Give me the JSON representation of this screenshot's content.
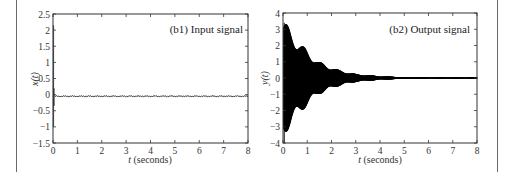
{
  "chart_data": [
    {
      "type": "line",
      "panel_label": "(b1) Input signal",
      "xlabel_italic": "t",
      "xlabel_rest": " (seconds)",
      "ylabel": "x(t)",
      "xlim": [
        0,
        8
      ],
      "ylim": [
        -1.5,
        2.5
      ],
      "xticks": [
        "0",
        "1",
        "2",
        "3",
        "4",
        "5",
        "6",
        "7",
        "8"
      ],
      "yticks": [
        "2.5",
        "2",
        "1.5",
        "1",
        "0.5",
        "0",
        "-0.5",
        "-1",
        "-1.5"
      ],
      "grid": false,
      "description": "Impulse near t≈0.02 s reaching ~2.15 and ~-1.0, followed by small noise around -0.05",
      "x": [
        0.0,
        0.02,
        0.02,
        0.04,
        0.06,
        0.1,
        1,
        2,
        3,
        4,
        5,
        6,
        7,
        8
      ],
      "values": [
        -0.05,
        2.15,
        -1.0,
        0.1,
        -0.3,
        -0.05,
        -0.05,
        -0.06,
        -0.05,
        -0.05,
        -0.05,
        -0.05,
        -0.05,
        -0.05
      ]
    },
    {
      "type": "line",
      "panel_label": "(b2) Output signal",
      "xlabel_italic": "t",
      "xlabel_rest": " (seconds)",
      "ylabel": "y(t)",
      "xlim": [
        0,
        8
      ],
      "ylim": [
        -4,
        4
      ],
      "xticks": [
        "0",
        "1",
        "2",
        "3",
        "4",
        "5",
        "6",
        "7",
        "8"
      ],
      "yticks": [
        "4",
        "3",
        "2",
        "1",
        "0",
        "-1",
        "-2",
        "-3",
        "-4"
      ],
      "grid": false,
      "description": "Decaying high-frequency oscillation; envelope peaks ~3.5 near t=0, ~-4 spike at start, decays to ~0.05 by t≈5",
      "envelope_t": [
        0.05,
        0.3,
        0.8,
        1.5,
        2.3,
        3.0,
        4.0,
        5.0,
        6.0,
        7.0,
        8.0
      ],
      "envelope_amplitude": [
        3.5,
        3.0,
        2.0,
        1.0,
        0.5,
        0.25,
        0.12,
        0.06,
        0.05,
        0.05,
        0.05
      ]
    }
  ]
}
